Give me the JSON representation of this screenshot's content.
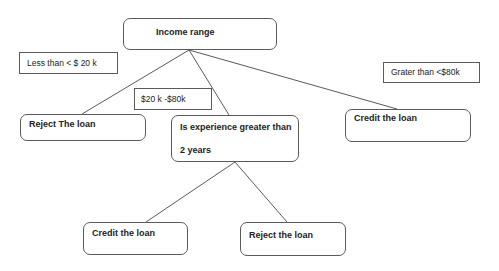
{
  "diagram": {
    "type": "decision-tree",
    "nodes": {
      "root": {
        "label": "Income range"
      },
      "cond_low": {
        "label": "Less than < $ 20  k"
      },
      "cond_high": {
        "label": "Grater than <$80k"
      },
      "cond_mid": {
        "label": "$20 k  -$80k"
      },
      "reject_low": {
        "label": "Reject The loan"
      },
      "experience": {
        "line1": "Is experience greater than",
        "line2": "2 years"
      },
      "credit_high": {
        "label": "Credit the loan"
      },
      "credit_exp": {
        "label": "Credit the loan"
      },
      "reject_exp": {
        "label": "Reject the  loan"
      }
    },
    "edges": [
      {
        "from": "root",
        "to": "reject_low",
        "condition": "Less than < $ 20  k"
      },
      {
        "from": "root",
        "to": "experience",
        "condition": "$20 k  -$80k"
      },
      {
        "from": "root",
        "to": "credit_high",
        "condition": "Grater than <$80k"
      },
      {
        "from": "experience",
        "to": "credit_exp"
      },
      {
        "from": "experience",
        "to": "reject_exp"
      }
    ],
    "colors": {
      "stroke": "#5a5a5a",
      "text": "#222222",
      "background": "#ffffff"
    }
  }
}
